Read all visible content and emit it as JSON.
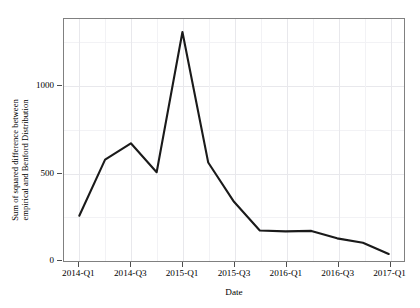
{
  "chart_data": {
    "type": "line",
    "title": "",
    "subtitle": "",
    "xlabel": "Date",
    "ylabel": "Sum of squared difference between empirical and Benford Distribution",
    "ylabel_line1": "Sum of squared difference between",
    "ylabel_line2": "empirical and Benford Distribution",
    "categories": [
      "2014-Q1",
      "2014-Q2",
      "2014-Q3",
      "2014-Q4",
      "2015-Q1",
      "2015-Q2",
      "2015-Q3",
      "2015-Q4",
      "2016-Q1",
      "2016-Q2",
      "2016-Q3",
      "2016-Q4",
      "2017-Q1"
    ],
    "values": [
      250,
      572,
      666,
      500,
      1305,
      556,
      330,
      165,
      160,
      163,
      120,
      95,
      30
    ],
    "x_tick_labels": [
      "2014-Q1",
      "2014-Q3",
      "2015-Q1",
      "2015-Q3",
      "2016-Q1",
      "2016-Q3",
      "2017-Q1"
    ],
    "x_tick_indices": [
      0,
      2,
      4,
      6,
      8,
      10,
      12
    ],
    "y_tick_labels": [
      "0",
      "500",
      "1000"
    ],
    "y_tick_values": [
      0,
      500,
      1000
    ],
    "ylim": [
      -10,
      1380
    ],
    "grid": true,
    "legend": "none",
    "line_color": "#1a1a1a",
    "panel_border_color": "#808080",
    "grid_color": "#e8e8ec",
    "background_color": "#ffffff"
  }
}
